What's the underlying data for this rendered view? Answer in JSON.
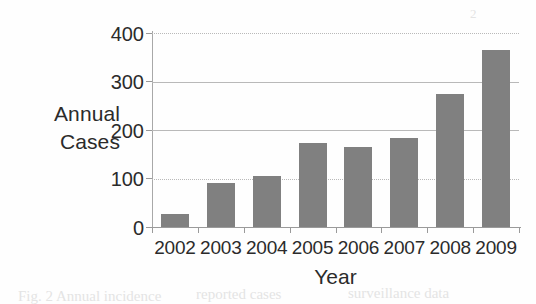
{
  "chart_data": {
    "type": "bar",
    "title": "",
    "subtitle": "",
    "xlabel": "Year",
    "ylabel": "Annual Cases",
    "ylabel_lines": [
      "Annual",
      "Cases"
    ],
    "categories": [
      "2002",
      "2003",
      "2004",
      "2005",
      "2006",
      "2007",
      "2008",
      "2009"
    ],
    "values": [
      27,
      91,
      105,
      173,
      166,
      184,
      274,
      366
    ],
    "series": [
      {
        "name": "Annual Cases",
        "values": [
          27,
          91,
          105,
          173,
          166,
          184,
          274,
          366
        ]
      }
    ],
    "ylim": [
      0,
      400
    ],
    "y_ticks": [
      0,
      100,
      200,
      300,
      400
    ],
    "y_tick_labels": [
      "0",
      "100",
      "200",
      "300",
      "400"
    ],
    "grid": true,
    "grid_axis": "y",
    "legend": false,
    "legend_position": "none",
    "bar_color": "#808080",
    "grid_color": "#b9b9b9",
    "axis_color": "#9a9a9a",
    "text_color": "#2b2b2b",
    "background": "#fefefe"
  },
  "axes": {
    "y_title_line1": "Annual",
    "y_title_line2": "Cases",
    "x_title": "Year"
  },
  "artifacts": {
    "bottom_left": "Fig. 2  Annual incidence",
    "bottom_mid": "reported cases",
    "bottom_right": "surveillance data",
    "top_right": "2"
  }
}
